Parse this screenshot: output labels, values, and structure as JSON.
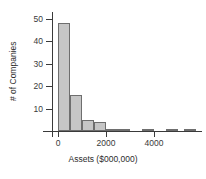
{
  "chart_data": {
    "type": "bar",
    "title": "",
    "subtitle": "",
    "xlabel": "Assets ($000,000)",
    "ylabel": "# of Companies",
    "grid": false,
    "legend": false,
    "legend_position": "none",
    "bar_color": "#c6c6c6",
    "bar_edge_color": "#6e6e6e",
    "axis_color": "#3a3a3a",
    "xlim": [
      -250,
      5750
    ],
    "ylim": [
      0,
      52
    ],
    "xticks": [
      {
        "value": 0,
        "label": "0"
      },
      {
        "value": 2000,
        "label": "2000"
      },
      {
        "value": 4000,
        "label": "4000"
      }
    ],
    "yticks": [
      {
        "value": 10,
        "label": "10"
      },
      {
        "value": 20,
        "label": "20"
      },
      {
        "value": 30,
        "label": "30"
      },
      {
        "value": 40,
        "label": "40"
      },
      {
        "value": 50,
        "label": "50"
      }
    ],
    "bin_width": 500,
    "bins": [
      {
        "x0": 0,
        "x1": 500,
        "label": "0-500",
        "value": 48
      },
      {
        "x0": 500,
        "x1": 1000,
        "label": "500-1000",
        "value": 16
      },
      {
        "x0": 1000,
        "x1": 1500,
        "label": "1000-1500",
        "value": 5
      },
      {
        "x0": 1500,
        "x1": 2000,
        "label": "1500-2000",
        "value": 4
      },
      {
        "x0": 2000,
        "x1": 2500,
        "label": "2000-2500",
        "value": 1
      },
      {
        "x0": 2500,
        "x1": 3000,
        "label": "2500-3000",
        "value": 1
      },
      {
        "x0": 3500,
        "x1": 4000,
        "label": "3500-4000",
        "value": 1
      },
      {
        "x0": 4500,
        "x1": 5000,
        "label": "4500-5000",
        "value": 1
      },
      {
        "x0": 5250,
        "x1": 5750,
        "label": "5250-5750",
        "value": 1
      }
    ],
    "categories": [
      "0-500",
      "500-1000",
      "1000-1500",
      "1500-2000",
      "2000-2500",
      "2500-3000",
      "3500-4000",
      "4500-5000",
      "5250-5750"
    ],
    "values": [
      48,
      16,
      5,
      4,
      1,
      1,
      1,
      1,
      1
    ]
  }
}
